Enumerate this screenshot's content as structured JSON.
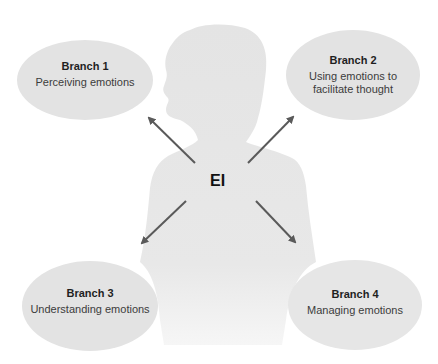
{
  "diagram": {
    "center": {
      "label": "EI"
    },
    "branches": [
      {
        "title": "Branch 1",
        "description": "Perceiving emotions"
      },
      {
        "title": "Branch 2",
        "description": "Using emotions to facilitate thought"
      },
      {
        "title": "Branch 3",
        "description": "Understanding emotions"
      },
      {
        "title": "Branch 4",
        "description": "Managing emotions"
      }
    ]
  },
  "colors": {
    "ellipse_fill": "#e4e4e4",
    "silhouette": "#e6e6e6",
    "arrow": "#5a5a5a",
    "text": "#3a3a3a",
    "background": "#ffffff"
  }
}
